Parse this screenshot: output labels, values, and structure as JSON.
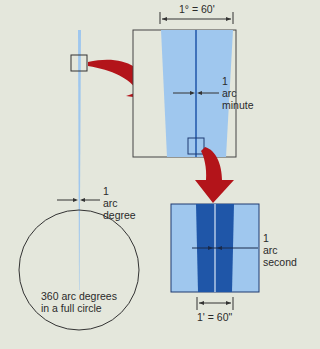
{
  "diagram": {
    "top_scale_label": "1° = 60'",
    "arc_minute_label": [
      "1",
      "arc",
      "minute"
    ],
    "arc_degree_label": [
      "1",
      "arc",
      "degree"
    ],
    "arc_second_label": [
      "1",
      "arc",
      "second"
    ],
    "circle_label": [
      "360 arc degrees",
      "in a full circle"
    ],
    "bottom_scale_label": "1' = 60\""
  },
  "colors": {
    "background": "#e4e7dc",
    "light_blue": "#9fc7ee",
    "dark_blue": "#1f56a8",
    "arrow_red": "#b3141a",
    "line": "#333333"
  }
}
